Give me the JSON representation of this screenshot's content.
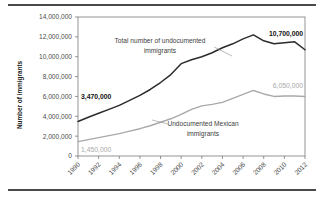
{
  "figure": {
    "has_top_rule": true,
    "has_bottom_rule": true
  },
  "chart_data": {
    "type": "line",
    "title": "",
    "xlabel": "",
    "ylabel": "Number of immigrants",
    "x": [
      1990,
      1991,
      1992,
      1993,
      1994,
      1995,
      1996,
      1997,
      1998,
      1999,
      2000,
      2001,
      2002,
      2003,
      2004,
      2005,
      2006,
      2007,
      2008,
      2009,
      2010,
      2011,
      2012
    ],
    "xtick_labels": [
      "1990",
      "1992",
      "1994",
      "1996",
      "1998",
      "2000",
      "2002",
      "2004",
      "2006",
      "2008",
      "2010",
      "2012"
    ],
    "xticks": [
      1990,
      1992,
      1994,
      1996,
      1998,
      2000,
      2002,
      2004,
      2006,
      2008,
      2010,
      2012
    ],
    "xlim": [
      1990,
      2012
    ],
    "ylim": [
      0,
      14000000
    ],
    "yticks": [
      0,
      2000000,
      4000000,
      6000000,
      8000000,
      10000000,
      12000000,
      14000000
    ],
    "ytick_labels": [
      "0",
      "2,000,000",
      "4,000,000",
      "6,000,000",
      "8,000,000",
      "10,000,000",
      "12,000,000",
      "14,000,000"
    ],
    "grid": false,
    "legend_position": "inline-annotations",
    "series": [
      {
        "name": "Total number of undocumented immigrants",
        "color": "#2b2b2b",
        "values": [
          3470000,
          3900000,
          4300000,
          4700000,
          5100000,
          5600000,
          6100000,
          6700000,
          7400000,
          8200000,
          9300000,
          9700000,
          10000000,
          10400000,
          10900000,
          11300000,
          11800000,
          12200000,
          11600000,
          11300000,
          11400000,
          11500000,
          10700000
        ]
      },
      {
        "name": "Undocumented Mexican immigrants",
        "color": "#a9a9a9",
        "values": [
          1450000,
          1650000,
          1850000,
          2050000,
          2250000,
          2500000,
          2750000,
          3050000,
          3400000,
          3750000,
          4200000,
          4700000,
          5050000,
          5200000,
          5400000,
          5800000,
          6200000,
          6600000,
          6250000,
          6000000,
          6050000,
          6050000,
          6000000
        ]
      }
    ],
    "annotations": [
      {
        "text": "Total number of undocumented",
        "kind": "series-label",
        "series": "total",
        "line": 1
      },
      {
        "text": "immigrants",
        "kind": "series-label",
        "series": "total",
        "line": 2
      },
      {
        "text": "Undocumented Mexican",
        "kind": "series-label",
        "series": "mexican",
        "line": 1
      },
      {
        "text": "immigrants",
        "kind": "series-label",
        "series": "mexican",
        "line": 2
      },
      {
        "text": "3,470,000",
        "kind": "value-label",
        "series": "total",
        "at_year": 1990,
        "value": 3470000
      },
      {
        "text": "10,700,000",
        "kind": "value-label",
        "series": "total",
        "at_year": 2012,
        "value": 10700000
      },
      {
        "text": "1,450,000",
        "kind": "value-label",
        "series": "mexican",
        "at_year": 1990,
        "value": 1450000
      },
      {
        "text": "6,050,000",
        "kind": "value-label",
        "series": "mexican",
        "at_year": 2012,
        "value": 6050000
      }
    ]
  }
}
